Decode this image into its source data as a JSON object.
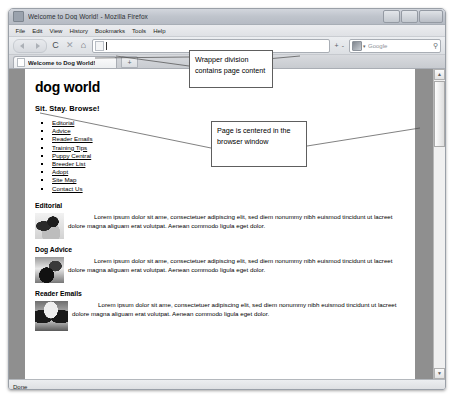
{
  "browser": {
    "title": "Welcome to Dog World! - Mozilla Firefox",
    "window_controls": {
      "minimize": "–",
      "maximize": "❐",
      "close": "✕"
    },
    "menus": [
      "File",
      "Edit",
      "View",
      "History",
      "Bookmarks",
      "Tools",
      "Help"
    ],
    "toolbar": {
      "back": "◀",
      "forward": "▶",
      "reload": "C",
      "stop": "✕",
      "home": "⌂",
      "address_value": "",
      "address_placeholder": "",
      "zoom_out": "+",
      "zoom_in": "-",
      "search_placeholder": "Google",
      "search_value": "",
      "search_icon": "⚲"
    },
    "tabs": [
      {
        "label": "Welcome to Dog World!",
        "active": true
      }
    ],
    "new_tab_label": "+",
    "scrollbar": {
      "up_arrow": "▲",
      "down_arrow": "▼"
    },
    "status": "Done"
  },
  "page": {
    "site_title": "dog world",
    "tagline": "Sit. Stay. Browse!",
    "nav_links": [
      "Editorial",
      "Advice",
      "Reader Emails",
      "Training Tips",
      "Puppy Central",
      "Breeder List",
      "Adopt",
      "Site Map",
      "Contact Us"
    ],
    "articles": [
      {
        "heading": "Editorial",
        "image_name": "jack-russell-terrier-photo",
        "body": "Lorem ipsum dolor sit ame, consectetuer adipiscing elit, sed diem nonummy nibh euismod tincidunt ut lacreet dolore magna aliguam erat volutpat. Aenean commodo ligula eget dolor."
      },
      {
        "heading": "Dog Advice",
        "image_name": "border-collie-photo",
        "body": "Lorem ipsum dolor sit ame, consectetuer adipiscing elit, sed diem nonummy nibh euismod tincidunt ut lacreet dolore magna aliguam erat volutpat. Aenean commodo ligula eget dolor."
      },
      {
        "heading": "Reader Emails",
        "image_name": "basset-hound-photo",
        "body": "Lorem ipsum dolor sit ame, consectetuer adipiscing elit, sed diem nonummy nibh euismod tincidunt ut lacreet dolore magna aliguam erat volutpat. Aenean commodo ligula eget dolor."
      }
    ]
  },
  "annotations": [
    {
      "id": "wrapper",
      "text": "Wrapper division contains page content"
    },
    {
      "id": "centered",
      "text": "Page is centered in the browser window"
    }
  ],
  "colors": {
    "page_background": "#8f8f8f",
    "wrapper_background": "#ffffff",
    "chrome": "#d6d8dc",
    "annotation_border": "#5e5e5e"
  }
}
